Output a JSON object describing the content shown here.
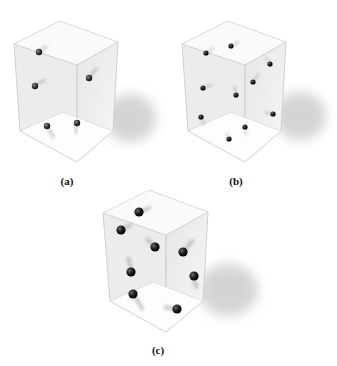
{
  "figure": {
    "panels": [
      {
        "id": "a",
        "label": "(a)",
        "particle_count": 5,
        "particles": [
          {
            "x": 39,
            "y": 52,
            "r": 3.2
          },
          {
            "x": 35,
            "y": 86,
            "r": 3.2
          },
          {
            "x": 89,
            "y": 78,
            "r": 3.2
          },
          {
            "x": 47,
            "y": 126,
            "r": 3.2
          },
          {
            "x": 77,
            "y": 123,
            "r": 3.2
          }
        ]
      },
      {
        "id": "b",
        "label": "(b)",
        "particle_count": 10,
        "particles": [
          {
            "x": 206,
            "y": 53,
            "r": 2.6
          },
          {
            "x": 231,
            "y": 46,
            "r": 2.6
          },
          {
            "x": 270,
            "y": 64,
            "r": 2.6
          },
          {
            "x": 253,
            "y": 82,
            "r": 2.6
          },
          {
            "x": 203,
            "y": 88,
            "r": 2.6
          },
          {
            "x": 236,
            "y": 95,
            "r": 2.6
          },
          {
            "x": 201,
            "y": 117,
            "r": 2.6
          },
          {
            "x": 273,
            "y": 114,
            "r": 2.6
          },
          {
            "x": 245,
            "y": 127,
            "r": 2.6
          },
          {
            "x": 229,
            "y": 139,
            "r": 2.6
          }
        ]
      },
      {
        "id": "c",
        "label": "(c)",
        "particle_count": 8,
        "particles": [
          {
            "x": 139,
            "y": 212,
            "r": 4.6
          },
          {
            "x": 121,
            "y": 230,
            "r": 4.6
          },
          {
            "x": 155,
            "y": 247,
            "r": 4.6
          },
          {
            "x": 183,
            "y": 252,
            "r": 4.6
          },
          {
            "x": 131,
            "y": 272,
            "r": 4.6
          },
          {
            "x": 194,
            "y": 276,
            "r": 4.6
          },
          {
            "x": 133,
            "y": 294,
            "r": 4.6
          },
          {
            "x": 177,
            "y": 309,
            "r": 4.6
          }
        ]
      }
    ],
    "colors": {
      "particle": "#2e2e2e",
      "box_edge": "#c8c8c8",
      "box_face": "#eeeeee",
      "shadow": "#d9d9d9"
    }
  }
}
